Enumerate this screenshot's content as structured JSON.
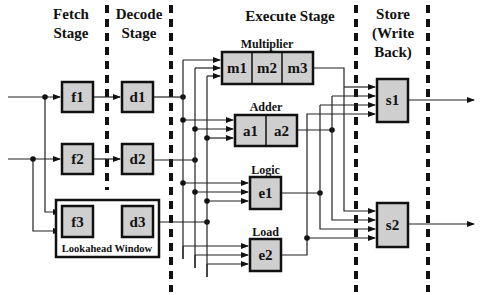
{
  "stages": {
    "fetch": [
      "Fetch",
      "Stage"
    ],
    "decode": [
      "Decode",
      "Stage"
    ],
    "execute": "Execute Stage",
    "store": [
      "Store",
      "(Write",
      "Back)"
    ]
  },
  "units": {
    "multiplier": "Multiplier",
    "adder": "Adder",
    "logic": "Logic",
    "load": "Load",
    "lookahead": "Lookahead Window"
  },
  "boxes": {
    "f1": "f1",
    "f2": "f2",
    "f3": "f3",
    "d1": "d1",
    "d2": "d2",
    "d3": "d3",
    "m1": "m1",
    "m2": "m2",
    "m3": "m3",
    "a1": "a1",
    "a2": "a2",
    "e1": "e1",
    "e2": "e2",
    "s1": "s1",
    "s2": "s2"
  },
  "colors": {
    "box_fill": "#cfcfcf",
    "stroke": "#111111",
    "background": "#ffffff"
  }
}
